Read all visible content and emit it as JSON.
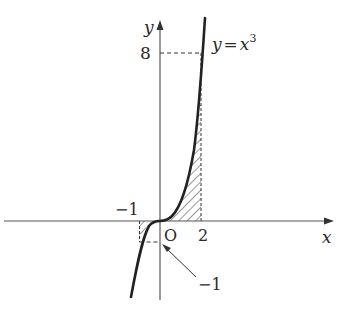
{
  "diagram": {
    "type": "function-graph",
    "function_label": "y = x³",
    "function_label_parts": {
      "lhs": "y",
      "eq": "=",
      "base": "x",
      "exp": "3"
    },
    "axes": {
      "x_label": "x",
      "y_label": "y",
      "origin_label": "O"
    },
    "ticks": {
      "x_pos": "2",
      "x_neg": "−1",
      "y_pos": "8",
      "y_neg": "−1"
    },
    "shaded_regions": [
      {
        "from": -1,
        "to": 0,
        "description": "region between curve and x-axis for -1 ≤ x ≤ 0"
      },
      {
        "from": 0,
        "to": 2,
        "description": "region between curve and x-axis for 0 ≤ x ≤ 2"
      }
    ],
    "annotation_arrow_label": "−1",
    "colors": {
      "ink": "#2a2a2a",
      "axis": "#555555",
      "background": "#ffffff"
    }
  }
}
